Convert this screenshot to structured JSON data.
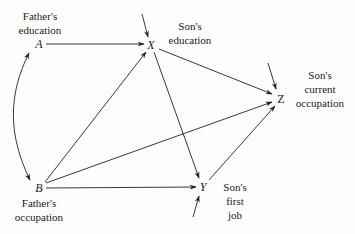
{
  "diagram": {
    "type": "path-diagram",
    "nodes": [
      {
        "id": "A",
        "symbol": "A",
        "label_lines": [
          "Father's",
          "education"
        ],
        "x": 39,
        "y": 44
      },
      {
        "id": "B",
        "symbol": "B",
        "label_lines": [
          "Father's",
          "occupation"
        ],
        "x": 38,
        "y": 187
      },
      {
        "id": "X",
        "symbol": "X",
        "label_lines": [
          "Son's",
          "education"
        ],
        "x": 151,
        "y": 45
      },
      {
        "id": "Y",
        "symbol": "Y",
        "label_lines": [
          "Son's",
          "first",
          "job"
        ],
        "x": 203,
        "y": 186
      },
      {
        "id": "Z",
        "symbol": "Z",
        "label_lines": [
          "Son's",
          "current",
          "occupation"
        ],
        "x": 280,
        "y": 98
      }
    ],
    "edges": [
      {
        "from": "A",
        "to": "X",
        "kind": "directed"
      },
      {
        "from": "B",
        "to": "X",
        "kind": "directed"
      },
      {
        "from": "B",
        "to": "Y",
        "kind": "directed"
      },
      {
        "from": "B",
        "to": "Z",
        "kind": "directed"
      },
      {
        "from": "X",
        "to": "Y",
        "kind": "directed"
      },
      {
        "from": "X",
        "to": "Z",
        "kind": "directed"
      },
      {
        "from": "Y",
        "to": "Z",
        "kind": "directed"
      },
      {
        "from": "A",
        "to": "B",
        "kind": "curved-bidirectional"
      }
    ],
    "residuals": [
      {
        "to": "X",
        "direction": "from-above"
      },
      {
        "to": "Y",
        "direction": "from-below"
      },
      {
        "to": "Z",
        "direction": "from-upper-left"
      }
    ],
    "colors": {
      "ink": "#222222",
      "background": "#fdfdfd"
    }
  },
  "labels": {
    "A": {
      "symbol": "A",
      "line1": "Father's",
      "line2": "education"
    },
    "B": {
      "symbol": "B",
      "line1": "Father's",
      "line2": "occupation"
    },
    "X": {
      "symbol": "X",
      "line1": "Son's",
      "line2": "education"
    },
    "Y": {
      "symbol": "Y",
      "line1": "Son's",
      "line2": "first",
      "line3": "job"
    },
    "Z": {
      "symbol": "Z",
      "line1": "Son's",
      "line2": "current",
      "line3": "occupation"
    }
  }
}
